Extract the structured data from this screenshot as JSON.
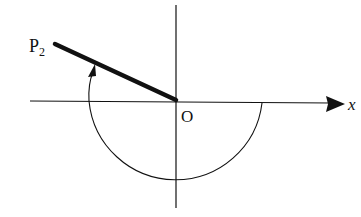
{
  "diagram": {
    "labels": {
      "point": "P",
      "point_subscript": "2",
      "origin": "O",
      "x_axis": "x"
    },
    "geometry": {
      "origin": [
        176,
        100
      ],
      "radius": 87,
      "p2": [
        55,
        44
      ],
      "arc": "from negative x-axis clockwise through bottom to positive x-axis, with arrow rising to segment OP2",
      "colors": {
        "stroke": "#111111",
        "background": "#ffffff"
      }
    }
  }
}
